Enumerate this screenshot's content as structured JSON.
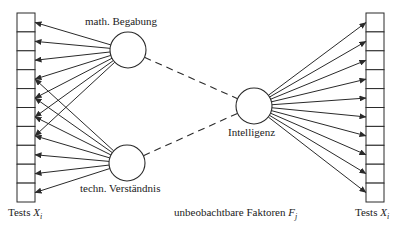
{
  "diagram": {
    "title": "",
    "colors": {
      "stroke": "#2a2a2a",
      "background": "#ffffff"
    },
    "left_tests": {
      "label_prefix": "Tests",
      "label_var": "X",
      "label_sub": "i",
      "box_count": 10,
      "x": 17,
      "y": 13,
      "width": 18,
      "box_height": 18.9
    },
    "right_tests": {
      "label_prefix": "Tests",
      "label_var": "X",
      "label_sub": "i",
      "box_count": 10,
      "x": 366,
      "y": 13,
      "width": 18,
      "box_height": 18.9
    },
    "factors": [
      {
        "id": "math",
        "label": "math. Begabung",
        "cx": 128,
        "cy": 50,
        "r": 18,
        "targets_left": [
          0,
          1,
          2,
          3,
          4,
          5,
          6
        ]
      },
      {
        "id": "techn",
        "label": "techn. Verständnis",
        "cx": 127,
        "cy": 163,
        "r": 18,
        "targets_left": [
          3,
          4,
          5,
          6,
          7,
          8,
          9
        ]
      },
      {
        "id": "intel",
        "label": "Intelligenz",
        "cx": 254,
        "cy": 106,
        "r": 18,
        "targets_right": [
          0,
          1,
          2,
          3,
          4,
          5,
          6,
          7,
          8,
          9
        ]
      }
    ],
    "dashed_links": [
      [
        "math",
        "intel"
      ],
      [
        "techn",
        "intel"
      ]
    ],
    "bottom_label": {
      "text": "unbeobachtbare Faktoren",
      "var": "F",
      "sub": "j"
    }
  }
}
